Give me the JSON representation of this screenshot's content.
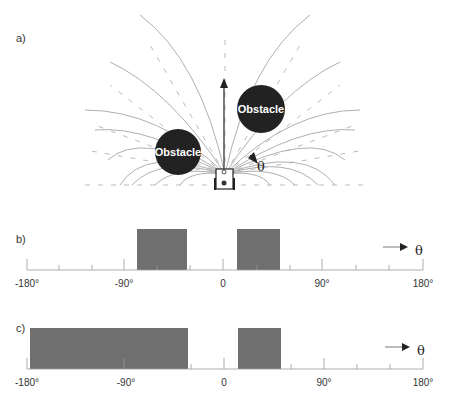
{
  "panel_a": {
    "label": "a)",
    "obstacle_left_label": "Obstacle",
    "obstacle_right_label": "Obstacle",
    "theta": "θ"
  },
  "panel_b": {
    "label": "b)",
    "theta": "θ",
    "ticks": [
      "-180°",
      "-90°",
      "0",
      "90°",
      "180°"
    ],
    "bars": [
      {
        "start": -78,
        "end": -33
      },
      {
        "start": 13,
        "end": 52
      }
    ]
  },
  "panel_c": {
    "label": "c)",
    "theta": "θ",
    "ticks": [
      "-180°",
      "-90°",
      "0",
      "90°",
      "180°"
    ],
    "bars": [
      {
        "start": -177,
        "end": -32
      },
      {
        "start": 14,
        "end": 53
      }
    ]
  },
  "colors": {
    "bar": "#6f6f6f",
    "obstacle": "#222222",
    "line": "#999999"
  }
}
